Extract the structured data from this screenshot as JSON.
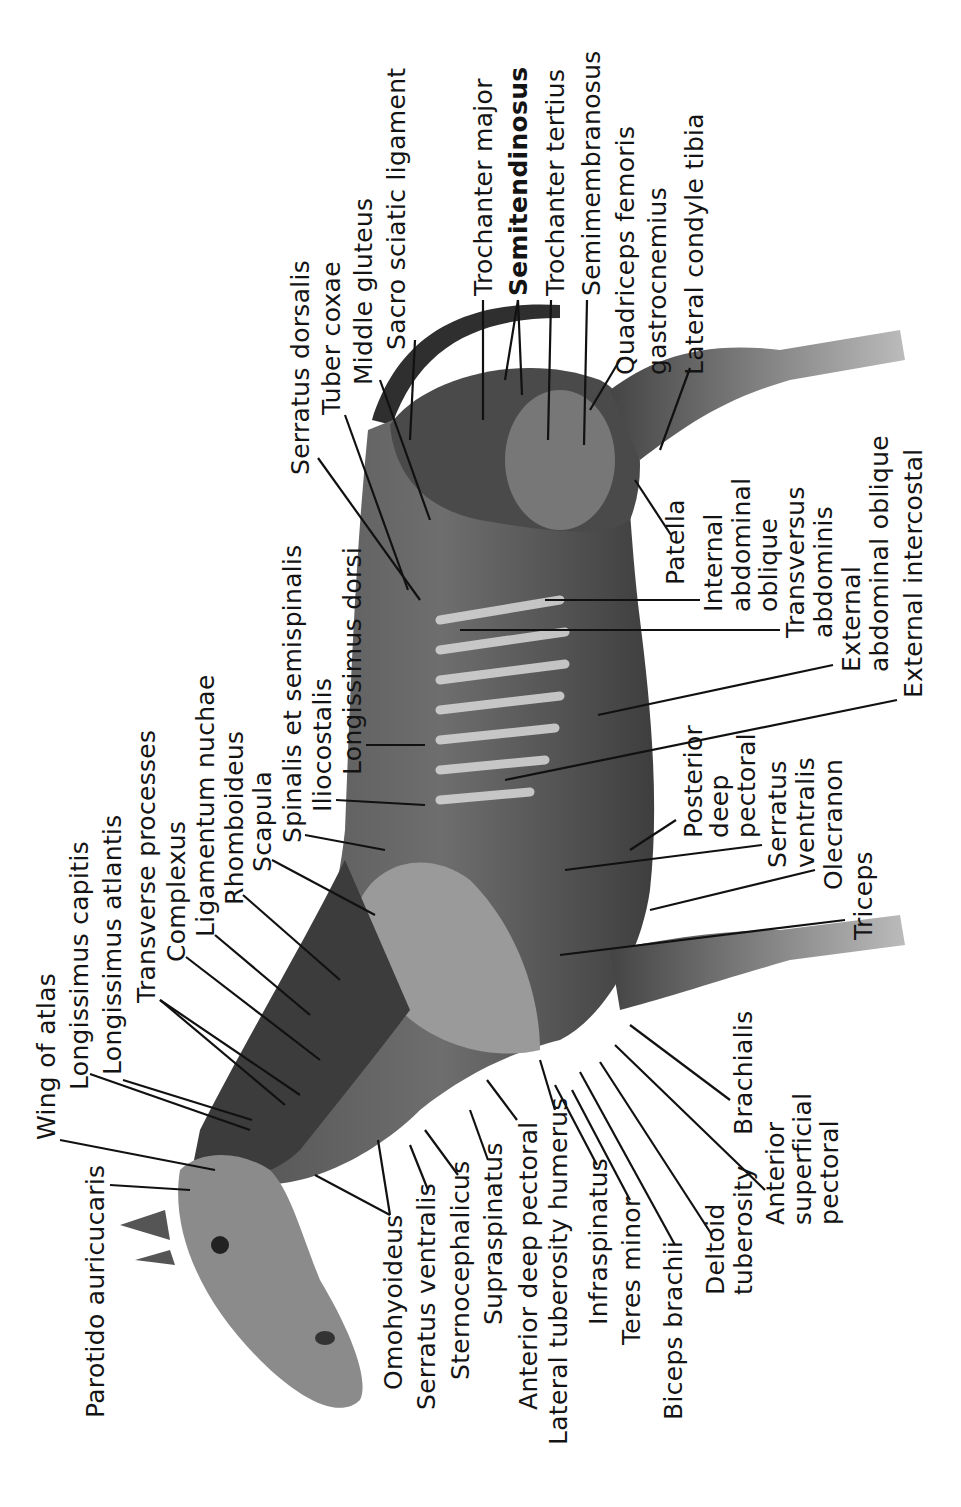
{
  "figure": {
    "orientation": "rotated 90° counter-clockwise (head at bottom, tail at top)",
    "colors": {
      "background": "#ffffff",
      "ink": "#141414",
      "muscle_dark": "#3a3a3a",
      "muscle_mid": "#7d7d7d",
      "muscle_light": "#c9c9c9"
    }
  },
  "labels": {
    "wing_of_atlas": "Wing of atlas",
    "longissimus_capitis": "Longissimus capitis",
    "longissimus_atlantis": "Longissimus atlantis",
    "transverse_processes": "Transverse processes",
    "complexus": "Complexus",
    "ligamentum_nuchae": "Ligamentum nuchae",
    "rhomboideus": "Rhomboideus",
    "scapula": "Scapula",
    "spinalis": "Spinalis et semispinalis",
    "iliocostalis": "Iliocostalis",
    "longissimus_dorsi": "Longissimus dorsi",
    "serratus_dorsalis": "Serratus dorsalis",
    "tuber_coxae": "Tuber coxae",
    "middle_gluteus": "Middle gluteus",
    "sacro_sciatic": "Sacro sciatic ligament",
    "trochanter_major": "Trochanter major",
    "semitendinosus": "Semitendinosus",
    "trochanter_tertius": "Trochanter tertius",
    "semimembranosus": "Semimembranosus",
    "quadriceps": "Quadriceps femoris",
    "gastrocnemius": "gastrocnemius",
    "lateral_condyle": "Lateral condyle tibia",
    "patella": "Patella",
    "internal_oblique_1": "Internal",
    "internal_oblique_2": "abdominal",
    "internal_oblique_3": "oblique",
    "transversus_1": "Transversus",
    "transversus_2": "abdominis",
    "external_oblique_1": "External",
    "external_oblique_2": "abdominal oblique",
    "external_intercostal": "External intercostal",
    "posterior_pectoral_1": "Posterior",
    "posterior_pectoral_2": "deep",
    "posterior_pectoral_3": "pectoral",
    "serratus_ventralis_r1": "Serratus",
    "serratus_ventralis_r2": "ventralis",
    "olecranon": "Olecranon",
    "triceps": "Triceps",
    "brachialis": "Brachialis",
    "ant_sup_pectoral_1": "Anterior",
    "ant_sup_pectoral_2": "superficial",
    "ant_sup_pectoral_3": "pectoral",
    "deltoid_1": "Deltoid",
    "deltoid_2": "tuberosity",
    "biceps": "Biceps brachii",
    "teres_minor": "Teres minor",
    "infraspinatus": "Infraspinatus",
    "lateral_tuberosity": "Lateral tuberosity humerus",
    "anterior_deep_pectoral": "Anterior deep pectoral",
    "supraspinatus": "Supraspinatus",
    "sternocephalicus": "Sternocephalicus",
    "serratus_ventralis_l": "Serratus ventralis",
    "omohyoideus": "Omohyoideus",
    "parotido": "Parotido auricucaris"
  }
}
